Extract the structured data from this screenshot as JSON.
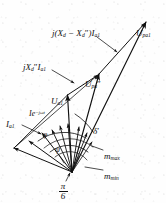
{
  "figure": {
    "kind": "phasor-vector-diagram",
    "ink_color": "#101010",
    "background_color": "#fefefe",
    "width": 166,
    "height": 203,
    "origin": {
      "x": 72,
      "y": 172
    }
  },
  "labels": {
    "reactance_difference": {
      "text_plain": "j(Xd - Xd\")Ia1",
      "base": "j(X",
      "sub1": "d",
      "minus": " − X",
      "sub2": "d",
      "prime": "″",
      "close": ")I",
      "sub3": "a1",
      "x": 52,
      "y": 29
    },
    "subtransient_reactance_drop": {
      "text_plain": "jXd\"Ia1",
      "base": "jX",
      "sub1": "d",
      "prime": "″",
      "mid": "I",
      "sub2": "a1",
      "x": 23,
      "y": 63
    },
    "emf_pa1": {
      "text_plain": "Upa1",
      "base": "U",
      "sub1": "pa1",
      "x": 136,
      "y": 29
    },
    "emf_pa_subtransient": {
      "text_plain": "Upa\"",
      "base": "U",
      "sub1": "pa",
      "prime": "″",
      "x": 85,
      "y": 80
    },
    "terminal_voltage": {
      "text_plain": "Ua1",
      "base": "U",
      "sub1": "a1",
      "x": 51,
      "y": 97
    },
    "current_exponential": {
      "text_plain": "Ie−jωt",
      "base": "Ie",
      "sup": "−jωt",
      "x": 29,
      "y": 110
    },
    "armature_current": {
      "text_plain": "Ia1",
      "base": "I",
      "sub1": "a1",
      "x": 6,
      "y": 120
    },
    "load_angle": {
      "text_plain": "δ′",
      "base": "δ",
      "prime": "′",
      "x": 93,
      "y": 127
    },
    "power_factor_angle": {
      "text_plain": "φ",
      "base": "φ",
      "x": 43,
      "y": 131
    },
    "inner_angle": {
      "text_plain": "ψ",
      "base": "ψ",
      "x": 55,
      "y": 146
    },
    "m_max": {
      "text_plain": "mmax",
      "base": "m",
      "sub1": "max",
      "x": 104,
      "y": 152
    },
    "m_min": {
      "text_plain": "mmin",
      "base": "m",
      "sub1": "min",
      "x": 104,
      "y": 172
    },
    "pi_over_six": {
      "numerator": "π",
      "denominator": "6",
      "text_plain": "π/6",
      "x": 59,
      "y": 183
    }
  },
  "leader_lines": [
    {
      "name": "leader-reactance-difference",
      "x1": 97,
      "y1": 37,
      "x2": 117,
      "y2": 52
    },
    {
      "name": "leader-subtransient-drop",
      "x1": 52,
      "y1": 70,
      "x2": 74,
      "y2": 82
    },
    {
      "name": "leader-m-max",
      "x1": 103,
      "y1": 150,
      "x2": 92,
      "y2": 146
    },
    {
      "name": "leader-m-min",
      "x1": 103,
      "y1": 170,
      "x2": 85,
      "y2": 166
    },
    {
      "name": "leader-armature-current",
      "x1": 22,
      "y1": 124,
      "x2": 42,
      "y2": 133
    },
    {
      "name": "leader-pi-over-six",
      "x1": 64,
      "y1": 181,
      "x2": 70,
      "y2": 172
    }
  ],
  "vectors": [
    {
      "name": "vector-emf-pa1",
      "from": [
        72,
        172
      ],
      "to": [
        146,
        22
      ],
      "arrow": true
    },
    {
      "name": "vector-emf-pa-subtransient",
      "from": [
        72,
        172
      ],
      "to": [
        99,
        74
      ],
      "arrow": true
    },
    {
      "name": "vector-terminal-voltage",
      "from": [
        72,
        172
      ],
      "to": [
        67,
        94
      ],
      "arrow": true
    },
    {
      "name": "vector-reactance-difference",
      "from": [
        99,
        74
      ],
      "to": [
        146,
        22
      ],
      "arrow": true
    },
    {
      "name": "vector-subtransient-drop",
      "from": [
        67,
        94
      ],
      "to": [
        99,
        74
      ],
      "arrow": true
    },
    {
      "name": "vector-armature-current",
      "from": [
        72,
        172
      ],
      "to": [
        28,
        140
      ],
      "arrow": true
    },
    {
      "name": "vector-current-exponential",
      "from": [
        72,
        172
      ],
      "to": [
        41,
        132
      ],
      "arrow": true
    },
    {
      "name": "vector-m-max-ray",
      "from": [
        72,
        172
      ],
      "to": [
        60,
        126
      ],
      "arrow": true
    },
    {
      "name": "vector-m-min-ray",
      "from": [
        72,
        172
      ],
      "to": [
        68,
        124
      ],
      "arrow": true
    },
    {
      "name": "vector-ray-a",
      "from": [
        72,
        172
      ],
      "to": [
        52,
        129
      ],
      "arrow": true
    },
    {
      "name": "vector-ray-b",
      "from": [
        72,
        172
      ],
      "to": [
        78,
        126
      ],
      "arrow": true
    },
    {
      "name": "vector-ray-c",
      "from": [
        72,
        172
      ],
      "to": [
        86,
        132
      ],
      "arrow": true
    },
    {
      "name": "vector-envelope-left",
      "from": [
        72,
        172
      ],
      "to": [
        14,
        148
      ],
      "arrow": true
    },
    {
      "name": "vector-envelope-outer",
      "from": [
        14,
        148
      ],
      "to": [
        67,
        94
      ],
      "arrow": false
    }
  ],
  "arcs": [
    {
      "name": "arc-load-angle",
      "radius": 58,
      "a1": -74,
      "a2": -48
    },
    {
      "name": "arc-power-factor-angle",
      "radius": 44,
      "a1": -128,
      "a2": -72
    },
    {
      "name": "arc-inner-angle",
      "radius": 30,
      "a1": -118,
      "a2": -62
    },
    {
      "name": "arc-m-max",
      "radius": 38,
      "a1": -108,
      "a2": -52
    },
    {
      "name": "arc-m-min",
      "radius": 22,
      "a1": -112,
      "a2": -58
    }
  ]
}
